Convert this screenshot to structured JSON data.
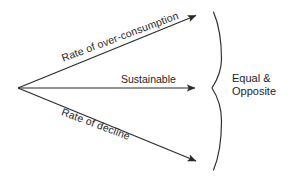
{
  "diagram": {
    "background_color": "#ffffff",
    "stroke_color": "#2a2a2a",
    "text_color": "#1d1d1d",
    "origin": {
      "x": 18,
      "y": 88
    },
    "arrows": [
      {
        "name": "over-consumption-arrow",
        "label": "Rate of over-consumption",
        "from": {
          "x": 18,
          "y": 88
        },
        "to": {
          "x": 199,
          "y": 14
        },
        "direction": "up-right",
        "angle_deg": -20.5
      },
      {
        "name": "sustainable-arrow",
        "label": "Sustainable",
        "from": {
          "x": 18,
          "y": 88
        },
        "to": {
          "x": 199,
          "y": 88
        },
        "direction": "right",
        "angle_deg": 0
      },
      {
        "name": "decline-arrow",
        "label": "Rate of decline",
        "from": {
          "x": 18,
          "y": 88
        },
        "to": {
          "x": 199,
          "y": 163
        },
        "direction": "down-right",
        "angle_deg": 20.5
      }
    ],
    "brace": {
      "name": "right-curly-brace",
      "top": {
        "x": 213,
        "y": 12
      },
      "pinch": {
        "x": 212,
        "y": 88
      },
      "bottom": {
        "x": 213,
        "y": 170
      },
      "bulge_x": 222
    },
    "brace_label": {
      "line1": "Equal &",
      "line2": "Opposite"
    }
  }
}
